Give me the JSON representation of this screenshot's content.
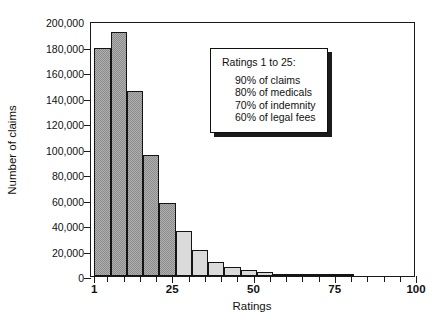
{
  "chart_data": {
    "type": "bar",
    "title": "",
    "subtitle": "",
    "xlabel": "Ratings",
    "ylabel": "Number of claims",
    "xlim": [
      0,
      100
    ],
    "ylim": [
      0,
      200000
    ],
    "grid": false,
    "legend_position": "none",
    "y_ticks": [
      0,
      20000,
      40000,
      60000,
      80000,
      100000,
      120000,
      140000,
      160000,
      180000,
      200000
    ],
    "y_tick_labels": [
      "0",
      "20,000",
      "40,000",
      "60,000",
      "80,000",
      "100,000",
      "120,000",
      "140,000",
      "160,000",
      "180,000",
      "200,000"
    ],
    "x_ticks_major": [
      1,
      25,
      50,
      75,
      100
    ],
    "x_tick_labels": [
      "1",
      "25",
      "50",
      "75",
      "100"
    ],
    "x_ticks_minor": [
      5,
      10,
      15,
      20,
      30,
      35,
      40,
      45,
      55,
      60,
      65,
      70,
      80,
      85,
      90,
      95
    ],
    "bin_width": 5,
    "bars": [
      {
        "x_start": 1,
        "x_end": 6,
        "value": 179000,
        "shade": "dark"
      },
      {
        "x_start": 6,
        "x_end": 11,
        "value": 191000,
        "shade": "dark"
      },
      {
        "x_start": 11,
        "x_end": 16,
        "value": 145000,
        "shade": "dark"
      },
      {
        "x_start": 16,
        "x_end": 21,
        "value": 95000,
        "shade": "dark"
      },
      {
        "x_start": 21,
        "x_end": 26,
        "value": 57000,
        "shade": "dark"
      },
      {
        "x_start": 26,
        "x_end": 31,
        "value": 35000,
        "shade": "light"
      },
      {
        "x_start": 31,
        "x_end": 36,
        "value": 20500,
        "shade": "light"
      },
      {
        "x_start": 36,
        "x_end": 41,
        "value": 11000,
        "shade": "light"
      },
      {
        "x_start": 41,
        "x_end": 46,
        "value": 7000,
        "shade": "light"
      },
      {
        "x_start": 46,
        "x_end": 51,
        "value": 5000,
        "shade": "light"
      },
      {
        "x_start": 51,
        "x_end": 56,
        "value": 3200,
        "shade": "light"
      },
      {
        "x_start": 56,
        "x_end": 61,
        "value": 1500,
        "shade": "light"
      },
      {
        "x_start": 61,
        "x_end": 66,
        "value": 1200,
        "shade": "light"
      },
      {
        "x_start": 66,
        "x_end": 71,
        "value": 600,
        "shade": "light"
      },
      {
        "x_start": 71,
        "x_end": 76,
        "value": 400,
        "shade": "light"
      },
      {
        "x_start": 76,
        "x_end": 81,
        "value": 300,
        "shade": "light"
      }
    ],
    "colors": {
      "dark_bar": "#8c8c8c",
      "light_bar": "#dadada",
      "bar_outline": "#141414",
      "axis": "#1a1a1a",
      "background": "#ffffff"
    },
    "annotation": {
      "heading": "Ratings 1 to 25:",
      "lines": [
        "90% of claims",
        "80% of medicals",
        "70% of indemnity",
        "60% of legal fees"
      ]
    }
  }
}
